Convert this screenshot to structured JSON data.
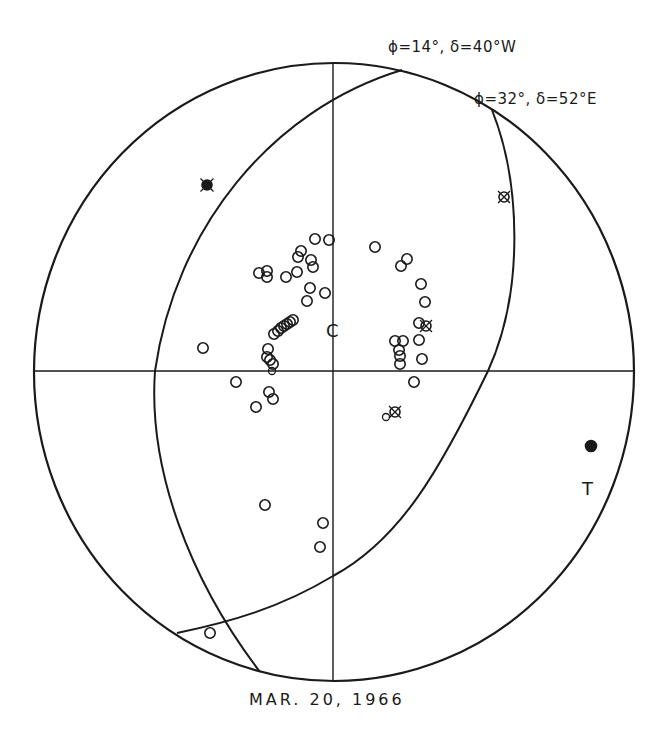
{
  "figure": {
    "caption": "MAR. 20, 1966",
    "plane_labels": [
      {
        "text": "ϕ=14°, δ=40°W",
        "x": 388,
        "y": 38
      },
      {
        "text": "ϕ=32°, δ=52°E",
        "x": 474,
        "y": 90
      }
    ],
    "axis_labels": {
      "tension": "T",
      "compression": "C"
    },
    "colors": {
      "ink": "#1a1a1a",
      "background": "#ffffff"
    }
  },
  "net": {
    "cx": 334,
    "cy": 372,
    "rx": 300,
    "ry": 309
  },
  "planes": [
    {
      "name": "plane-phi14-delta40W",
      "path": "M402,70 C270,110 175,230 155,371 C148,470 190,580 260,672"
    },
    {
      "name": "plane-phi32-delta52E",
      "path": "M492,110 C520,180 525,290 488,371 C440,470 400,540 333,576 C280,608 230,622 177,633"
    }
  ],
  "symbols": {
    "open_circles": [
      [
        315,
        239
      ],
      [
        329,
        240
      ],
      [
        301,
        251
      ],
      [
        298,
        257
      ],
      [
        311,
        260
      ],
      [
        313,
        267
      ],
      [
        259,
        273
      ],
      [
        267,
        271
      ],
      [
        267,
        277
      ],
      [
        286,
        277
      ],
      [
        297,
        272
      ],
      [
        310,
        288
      ],
      [
        325,
        293
      ],
      [
        307,
        301
      ],
      [
        375,
        247
      ],
      [
        407,
        259
      ],
      [
        401,
        266
      ],
      [
        421,
        284
      ],
      [
        425,
        302
      ],
      [
        419,
        323
      ],
      [
        419,
        340
      ],
      [
        395,
        341
      ],
      [
        403,
        341
      ],
      [
        399,
        350
      ],
      [
        400,
        356
      ],
      [
        422,
        359
      ],
      [
        400,
        364
      ],
      [
        414,
        382
      ],
      [
        293,
        320
      ],
      [
        290,
        322
      ],
      [
        287,
        324
      ],
      [
        284,
        326
      ],
      [
        281,
        328
      ],
      [
        278,
        331
      ],
      [
        274,
        334
      ],
      [
        268,
        349
      ],
      [
        267,
        357
      ],
      [
        270,
        360
      ],
      [
        273,
        364
      ],
      [
        203,
        348
      ],
      [
        236,
        382
      ],
      [
        269,
        392
      ],
      [
        273,
        399
      ],
      [
        256,
        407
      ],
      [
        265,
        505
      ],
      [
        323,
        523
      ],
      [
        320,
        547
      ],
      [
        210,
        633
      ]
    ],
    "small_circles": [
      [
        272,
        371
      ],
      [
        386,
        417
      ]
    ],
    "crossed_circles": [
      [
        504,
        197
      ],
      [
        426,
        326
      ],
      [
        395,
        412
      ]
    ],
    "crossed_filled": [
      [
        207,
        185
      ]
    ],
    "filled_dots": [
      [
        591,
        446
      ]
    ]
  }
}
